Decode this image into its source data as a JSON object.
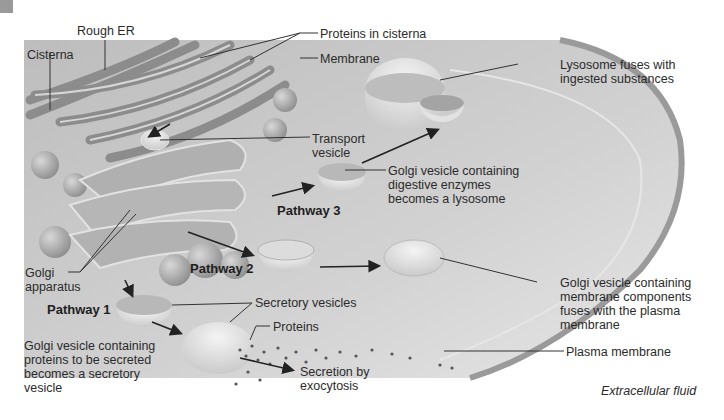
{
  "figure": {
    "labels": {
      "rough_er": "Rough ER",
      "cisterna": "Cisterna",
      "proteins_in_cisterna": "Proteins in cisterna",
      "membrane": "Membrane",
      "transport_vesicle": "Transport\nvesicle",
      "lysosome_fuses": "Lysosome fuses with\ningested substances",
      "golgi_lysosome": "Golgi vesicle containing\ndigestive enzymes\nbecomes a lysosome",
      "golgi_apparatus": "Golgi\napparatus",
      "golgi_membrane": "Golgi vesicle containing\nmembrane components\nfuses with the plasma\nmembrane",
      "secretory_vesicles": "Secretory vesicles",
      "proteins": "Proteins",
      "golgi_secreted": "Golgi vesicle containing\nproteins to be secreted\nbecomes a secretory\nvesicle",
      "secretion": "Secretion by\nexocytosis",
      "plasma_membrane": "Plasma membrane",
      "extracellular_fluid": "Extracellular fluid"
    },
    "pathways": [
      {
        "id": 1,
        "label": "Pathway 1"
      },
      {
        "id": 2,
        "label": "Pathway 2"
      },
      {
        "id": 3,
        "label": "Pathway 3"
      }
    ],
    "colors": {
      "cytoplasm": "#c9c9c9",
      "organelle": "#a8a8a8",
      "vesicle": "#e8e8e8",
      "line": "#333333",
      "dot": "#555555"
    }
  }
}
